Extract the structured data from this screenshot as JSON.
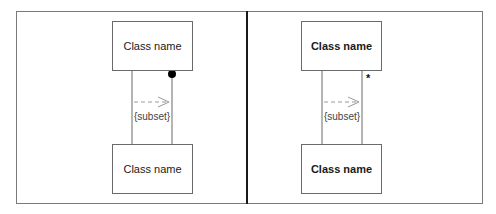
{
  "diagram": {
    "type": "uml-association-subset-comparison",
    "colors": {
      "frame": "#7a7a7a",
      "divider": "#1a1a1a",
      "box_border": "#6a6a6a",
      "line": "#6a6a6a",
      "dashed_arrow": "#9a9a9a",
      "dot": "#000000",
      "text": "#1a1a1a"
    },
    "panels": [
      {
        "id": "left",
        "top_class": {
          "label": "Class name",
          "bold": false
        },
        "bottom_class": {
          "label": "Class name",
          "bold": false
        },
        "constraint": "{subset}",
        "arrow_direction": "right",
        "end_marker": {
          "type": "filled-dot",
          "label": ""
        }
      },
      {
        "id": "right",
        "top_class": {
          "label": "Class name",
          "bold": true
        },
        "bottom_class": {
          "label": "Class name",
          "bold": true
        },
        "constraint": "{subset}",
        "arrow_direction": "right",
        "end_marker": {
          "type": "multiplicity",
          "label": "*"
        }
      }
    ]
  }
}
